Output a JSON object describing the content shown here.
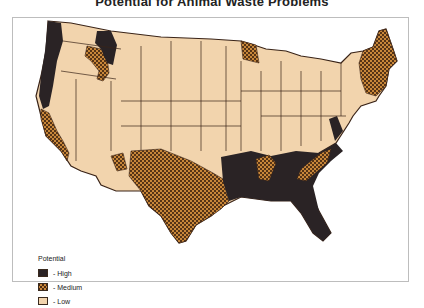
{
  "title": "Potential for Animal Waste Problems",
  "legend": {
    "title": "Potential",
    "items": [
      {
        "key": "high",
        "label": "- High",
        "color": "#2a2325"
      },
      {
        "key": "medium",
        "label": "- Medium",
        "color": "#c8873a",
        "pattern": "crosshatch"
      },
      {
        "key": "low",
        "label": "- Low",
        "color": "#f2d4ad"
      }
    ]
  },
  "colors": {
    "high": "#2a2325",
    "medium_fill": "#c8873a",
    "medium_hatch": "#4a2a12",
    "low": "#f2d4ad",
    "boundary": "#3a2418",
    "frame": "#bdbdbd"
  },
  "regions": {
    "high": [
      "Pacific Northwest coast",
      "Northern Idaho",
      "Southeast US",
      "Florida",
      "Lower Mississippi",
      "Chesapeake area"
    ],
    "medium": [
      "Central/Southern California",
      "Southern Idaho",
      "Southern Utah",
      "Texas & Oklahoma",
      "New Mexico east",
      "Northern Minnesota",
      "New England (Maine, NH, VT)",
      "Kentucky/Tennessee pockets",
      "Southern Appalachia"
    ],
    "low": [
      "Great Plains",
      "Mountain West",
      "Midwest",
      "Great Lakes",
      "Southwest deserts"
    ]
  }
}
